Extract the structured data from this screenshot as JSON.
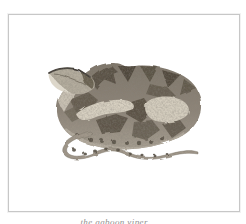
{
  "window": {
    "width": 246,
    "height": 224,
    "background": "#ffffff"
  },
  "plate": {
    "frame": {
      "border_color": "#c7c7c7"
    },
    "caption": "the gaboon viper.",
    "caption_color": "#8f8f8f"
  },
  "illustration": {
    "name": "coiled-viper-engraving",
    "palette": {
      "body_mid": "#8d8478",
      "body_dark": "#554d41",
      "body_darkest": "#463f35",
      "blotch_light": "#d6cfc0",
      "belly_light": "#b6aea1",
      "head_light": "#ddd7ca",
      "head_base": "#b3ac9d",
      "tail": "#a0978a",
      "spot": "#4f483d"
    }
  }
}
